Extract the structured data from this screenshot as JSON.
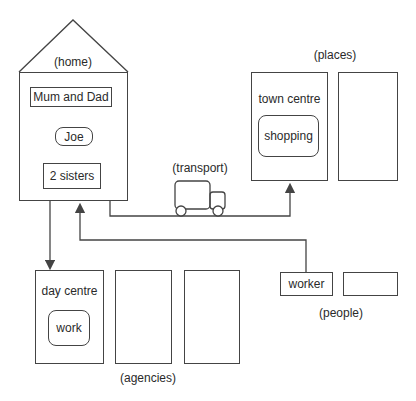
{
  "diagram": {
    "home": {
      "label": "(home)",
      "members": [
        "Mum and Dad",
        "Joe",
        "2 sisters"
      ]
    },
    "places": {
      "label": "(places)",
      "town_centre": "town centre",
      "activity": "shopping"
    },
    "transport": {
      "label": "(transport)",
      "icon": "truck-icon"
    },
    "agencies": {
      "label": "(agencies)",
      "day_centre": "day centre",
      "activity": "work"
    },
    "people": {
      "label": "(people)",
      "worker": "worker"
    },
    "colors": {
      "line": "#444444",
      "background": "#ffffff",
      "text": "#2a2a2a"
    }
  }
}
